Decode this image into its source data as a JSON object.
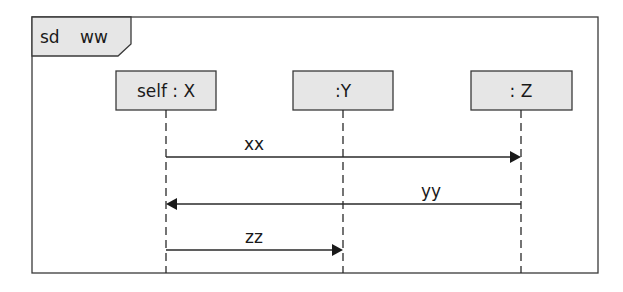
{
  "diagram": {
    "type": "uml-sequence-diagram",
    "frame": {
      "kind": "sd",
      "name": "ww"
    },
    "lifelines": [
      {
        "id": "X",
        "label": "self : X",
        "x": 166
      },
      {
        "id": "Y",
        "label": ":Y",
        "x": 343
      },
      {
        "id": "Z",
        "label": ": Z",
        "x": 521
      }
    ],
    "messages": [
      {
        "label": "xx",
        "from": "X",
        "to": "Z"
      },
      {
        "label": "yy",
        "from": "Z",
        "to": "X"
      },
      {
        "label": "zz",
        "from": "X",
        "to": "Y"
      }
    ],
    "colors": {
      "box_fill": "#e6e6e6",
      "line": "#2a2a2a",
      "background": "#ffffff"
    }
  }
}
